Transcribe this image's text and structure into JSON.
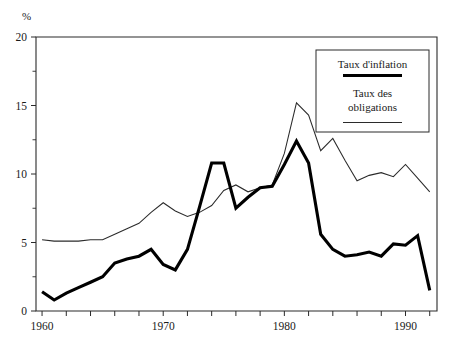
{
  "chart_data": {
    "type": "line",
    "title": "",
    "subtitle": "",
    "xlabel": "",
    "ylabel": "%",
    "yunit_label": "%",
    "xlim": [
      1959.5,
      1992.6
    ],
    "ylim": [
      0,
      20
    ],
    "grid": false,
    "yticks": [
      0,
      5,
      10,
      15,
      20
    ],
    "ytick_labels": [
      "0",
      "5",
      "10",
      "15",
      "20"
    ],
    "yminor_ticks": [
      2.5,
      7.5,
      12.5,
      17.5
    ],
    "xticks": [
      1960,
      1962,
      1964,
      1966,
      1968,
      1970,
      1972,
      1974,
      1976,
      1978,
      1980,
      1982,
      1984,
      1986,
      1988,
      1990,
      1992
    ],
    "xtick_labels_shown": [
      "1960",
      "1970",
      "1980",
      "1990"
    ],
    "xtick_labels_shown_values": [
      1960,
      1970,
      1980,
      1990
    ],
    "legend_position": "upper-right",
    "x": [
      1960,
      1961,
      1962,
      1963,
      1964,
      1965,
      1966,
      1967,
      1968,
      1969,
      1970,
      1971,
      1972,
      1973,
      1974,
      1975,
      1976,
      1977,
      1978,
      1979,
      1980,
      1981,
      1982,
      1983,
      1984,
      1985,
      1986,
      1987,
      1988,
      1989,
      1990,
      1991,
      1992
    ],
    "series": [
      {
        "name": "Taux d'inflation",
        "style": "thick",
        "color": "#000000",
        "values": [
          1.4,
          0.8,
          1.3,
          1.7,
          2.1,
          2.5,
          3.5,
          3.8,
          4.0,
          4.5,
          3.4,
          3.0,
          4.5,
          7.6,
          10.8,
          10.8,
          7.5,
          8.3,
          9.0,
          9.1,
          10.7,
          12.4,
          10.8,
          5.6,
          4.5,
          4.0,
          4.1,
          4.3,
          4.0,
          4.9,
          4.8,
          5.5,
          1.5
        ]
      },
      {
        "name": "Taux des obligations",
        "style": "thin",
        "color": "#2b2b2b",
        "values": [
          5.2,
          5.1,
          5.1,
          5.1,
          5.2,
          5.2,
          5.6,
          6.0,
          6.4,
          7.2,
          7.9,
          7.3,
          6.9,
          7.2,
          7.7,
          8.8,
          9.2,
          8.7,
          9.0,
          9.2,
          11.5,
          15.2,
          14.3,
          11.7,
          12.6,
          11.0,
          9.5,
          9.9,
          10.1,
          9.8,
          10.7,
          9.7,
          8.7
        ]
      }
    ]
  },
  "legend": {
    "items": [
      {
        "label": "Taux d'inflation",
        "style": "thick"
      },
      {
        "label_line1": "Taux des",
        "label_line2": "obligations",
        "style": "thin"
      }
    ],
    "item1_label": "Taux d'inflation",
    "item2_label_line1": "Taux des",
    "item2_label_line2": "obligations"
  },
  "axes": {
    "y_unit": "%",
    "y_labels": [
      "20",
      "15",
      "10",
      "5",
      "0"
    ],
    "x_labels": [
      "1960",
      "1970",
      "1980",
      "1990"
    ]
  }
}
